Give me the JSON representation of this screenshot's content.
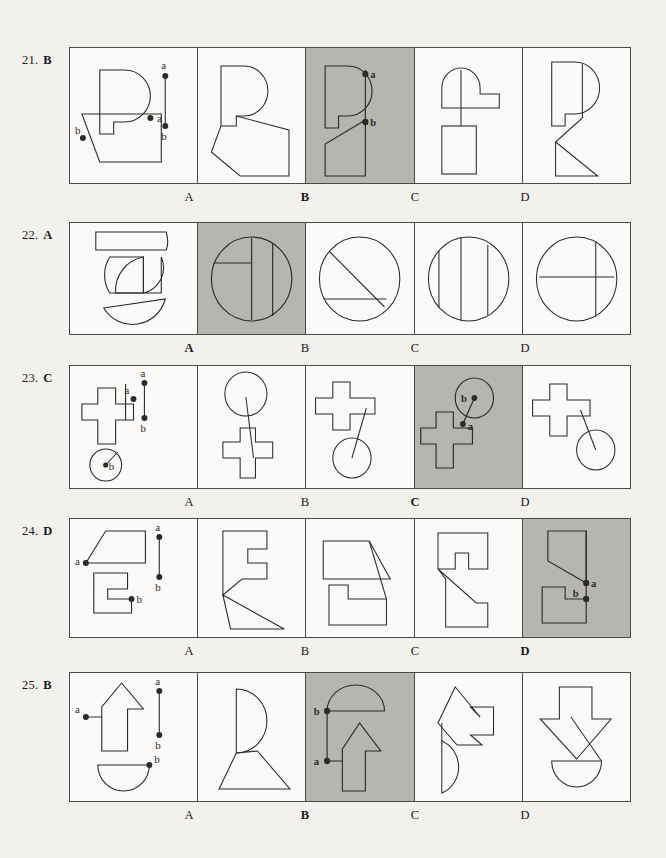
{
  "page": {
    "background_color": "#f3f1ed",
    "ink_color": "#2b2b2b",
    "highlight_color": "#b7b5b0",
    "cell_background": "#fbfaf8"
  },
  "option_labels": [
    "A",
    "B",
    "C",
    "D"
  ],
  "point_labels": {
    "a": "a",
    "b": "b"
  },
  "questions": [
    {
      "number": "21.",
      "answer": "B",
      "correct_index": 1,
      "prompt_points": [
        "a",
        "b"
      ],
      "options": [
        {
          "label": "A",
          "highlighted": false
        },
        {
          "label": "B",
          "highlighted": true
        },
        {
          "label": "C",
          "highlighted": false
        },
        {
          "label": "D",
          "highlighted": false
        }
      ]
    },
    {
      "number": "22.",
      "answer": "A",
      "correct_index": 0,
      "prompt_points": [],
      "options": [
        {
          "label": "A",
          "highlighted": true
        },
        {
          "label": "B",
          "highlighted": false
        },
        {
          "label": "C",
          "highlighted": false
        },
        {
          "label": "D",
          "highlighted": false
        }
      ]
    },
    {
      "number": "23.",
      "answer": "C",
      "correct_index": 2,
      "prompt_points": [
        "a",
        "b"
      ],
      "options": [
        {
          "label": "A",
          "highlighted": false
        },
        {
          "label": "B",
          "highlighted": false
        },
        {
          "label": "C",
          "highlighted": true
        },
        {
          "label": "D",
          "highlighted": false
        }
      ]
    },
    {
      "number": "24.",
      "answer": "D",
      "correct_index": 3,
      "prompt_points": [
        "a",
        "b"
      ],
      "options": [
        {
          "label": "A",
          "highlighted": false
        },
        {
          "label": "B",
          "highlighted": false
        },
        {
          "label": "C",
          "highlighted": false
        },
        {
          "label": "D",
          "highlighted": true
        }
      ]
    },
    {
      "number": "25.",
      "answer": "B",
      "correct_index": 1,
      "prompt_points": [
        "a",
        "b"
      ],
      "options": [
        {
          "label": "A",
          "highlighted": false
        },
        {
          "label": "B",
          "highlighted": true
        },
        {
          "label": "C",
          "highlighted": false
        },
        {
          "label": "D",
          "highlighted": false
        }
      ]
    }
  ]
}
